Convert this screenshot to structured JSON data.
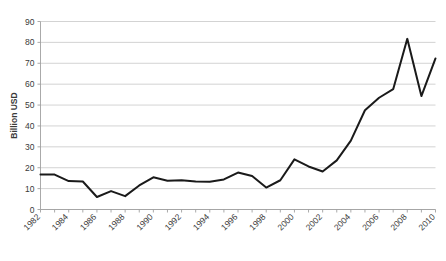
{
  "chart_data": {
    "type": "line",
    "title": "",
    "xlabel": "",
    "ylabel": "Billion USD",
    "ylim": [
      0,
      90
    ],
    "ytick_step": 10,
    "grid": true,
    "legend": "none",
    "line_color": "#1a1a1a",
    "gridline_color": "#c8c8c8",
    "axis_color": "#a0a0a0",
    "xtick_label_rotation": -45,
    "xtick_labels": [
      "1982",
      "1984",
      "1986",
      "1988",
      "1990",
      "1992",
      "1994",
      "1996",
      "1998",
      "2000",
      "2002",
      "2004",
      "2006",
      "2008",
      "2010"
    ],
    "ytick_labels": [
      "0",
      "10",
      "20",
      "30",
      "40",
      "50",
      "60",
      "70",
      "80",
      "90"
    ],
    "x": [
      1982,
      1983,
      1984,
      1985,
      1986,
      1987,
      1988,
      1989,
      1990,
      1991,
      1992,
      1993,
      1994,
      1995,
      1996,
      1997,
      1998,
      1999,
      2000,
      2001,
      2002,
      2003,
      2004,
      2005,
      2006,
      2007,
      2008,
      2009,
      2010
    ],
    "values": [
      16.8,
      16.7,
      13.6,
      13.4,
      6.0,
      8.8,
      6.4,
      11.5,
      15.4,
      13.8,
      14.0,
      13.4,
      13.3,
      14.4,
      17.7,
      16.0,
      10.5,
      14.0,
      24.0,
      20.6,
      18.2,
      23.5,
      33.0,
      47.5,
      53.5,
      57.6,
      81.7,
      54.3,
      72.3
    ],
    "series": [
      {
        "name": "Billion USD",
        "values": [
          16.8,
          16.7,
          13.6,
          13.4,
          6.0,
          8.8,
          6.4,
          11.5,
          15.4,
          13.8,
          14.0,
          13.4,
          13.3,
          14.4,
          17.7,
          16.0,
          10.5,
          14.0,
          24.0,
          20.6,
          18.2,
          23.5,
          33.0,
          47.5,
          53.5,
          57.6,
          81.7,
          54.3,
          72.3
        ]
      }
    ]
  }
}
